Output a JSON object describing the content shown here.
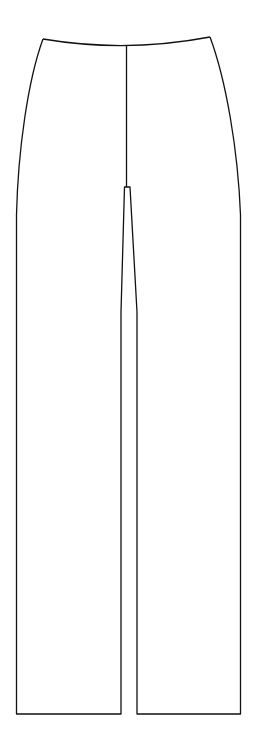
{
  "figure": {
    "background": "#ffffff",
    "stroke": "#111111"
  }
}
